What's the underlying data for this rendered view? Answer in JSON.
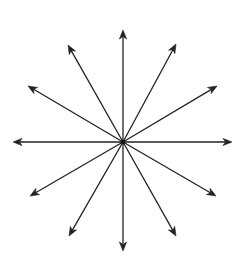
{
  "diagram": {
    "type": "radiating-arrows",
    "arrow_count": 12,
    "center": [
      123,
      142
    ],
    "stroke_color": "#222222",
    "background_color": "#ffffff",
    "arrows": [
      {
        "angle_deg": 90,
        "tip": [
          123,
          30
        ]
      },
      {
        "angle_deg": 60,
        "tip": [
          176,
          44
        ]
      },
      {
        "angle_deg": 30,
        "tip": [
          217,
          86
        ]
      },
      {
        "angle_deg": 0,
        "tip": [
          232,
          142
        ]
      },
      {
        "angle_deg": -30,
        "tip": [
          216,
          196
        ]
      },
      {
        "angle_deg": -60,
        "tip": [
          176,
          236
        ]
      },
      {
        "angle_deg": -90,
        "tip": [
          123,
          251
        ]
      },
      {
        "angle_deg": -120,
        "tip": [
          69,
          236
        ]
      },
      {
        "angle_deg": -150,
        "tip": [
          30,
          196
        ]
      },
      {
        "angle_deg": 180,
        "tip": [
          13,
          142
        ]
      },
      {
        "angle_deg": 150,
        "tip": [
          28,
          86
        ]
      },
      {
        "angle_deg": 120,
        "tip": [
          68,
          45
        ]
      }
    ]
  }
}
